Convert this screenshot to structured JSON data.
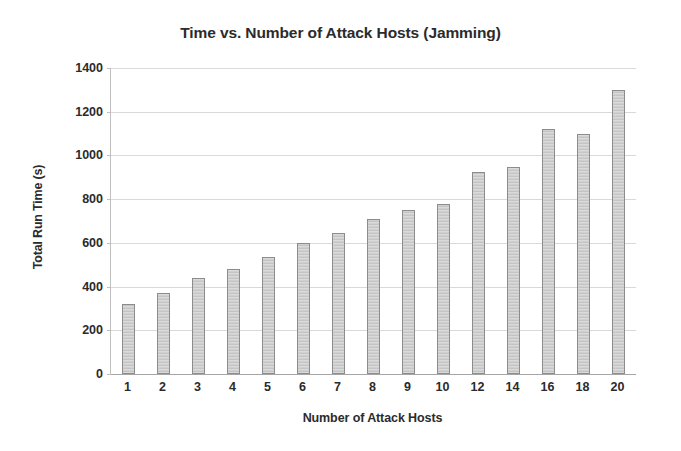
{
  "chart_data": {
    "type": "bar",
    "title": "Time vs. Number of Attack Hosts (Jamming)",
    "xlabel": "Number of Attack Hosts",
    "ylabel": "Total Run Time (s)",
    "categories": [
      "1",
      "2",
      "3",
      "4",
      "5",
      "6",
      "7",
      "8",
      "9",
      "10",
      "12",
      "14",
      "16",
      "18",
      "20"
    ],
    "values": [
      320,
      370,
      440,
      480,
      535,
      600,
      645,
      710,
      750,
      780,
      925,
      945,
      1120,
      1100,
      1300
    ],
    "ylim": [
      0,
      1400
    ],
    "ytick_labels": [
      "0",
      "200",
      "400",
      "600",
      "800",
      "1000",
      "1200",
      "1400"
    ],
    "ytick_values": [
      0,
      200,
      400,
      600,
      800,
      1000,
      1200,
      1400
    ],
    "grid": true,
    "legend": "none",
    "bar_color": "#c9c9c9",
    "bar_border_color": "#8c8c8c",
    "grid_color": "#d9d9d9",
    "text_color": "#2b2b2b",
    "background": "#ffffff"
  }
}
